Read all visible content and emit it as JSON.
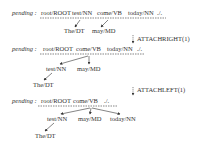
{
  "pending_label": "pending :",
  "states": [
    {
      "pending": [
        "root/ROOT",
        "test/NN",
        "come/VB",
        "today/NN",
        "./."
      ],
      "children": [
        {
          "word": "The/DT",
          "head": "test/NN"
        },
        {
          "word": "may/MD",
          "head": "come/VB"
        }
      ]
    },
    {
      "pending": [
        "root/ROOT",
        "come/VB",
        "today/NN",
        "./."
      ],
      "children": [
        {
          "word": "test/NN",
          "head": "come/VB"
        },
        {
          "word": "may/MD",
          "head": "come/VB"
        },
        {
          "word": "The/DT",
          "head": "test/NN"
        }
      ]
    },
    {
      "pending": [
        "root/ROOT",
        "come/VB",
        "./."
      ],
      "children": [
        {
          "word": "test/NN",
          "head": "come/VB"
        },
        {
          "word": "may/MD",
          "head": "come/VB"
        },
        {
          "word": "today/NN",
          "head": "come/VB"
        },
        {
          "word": "The/DT",
          "head": "test/NN"
        }
      ]
    }
  ],
  "actions": [
    {
      "label": "ATTACHRIGHT(1)"
    },
    {
      "label": "ATTACHLEFT(1)"
    }
  ]
}
